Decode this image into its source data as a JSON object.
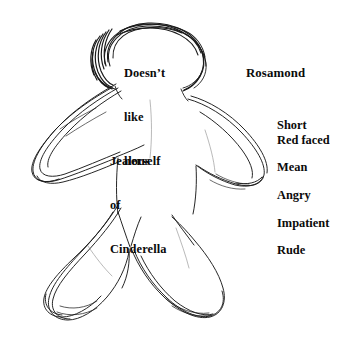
{
  "figure": {
    "title": "Rosamond",
    "stroke_color": "#1a1a1a",
    "background_color": "#ffffff"
  },
  "annotations": {
    "head": {
      "name": "doesnt-like-herself",
      "lines": [
        "Doesn’t",
        "like",
        "herself"
      ],
      "location": "head"
    },
    "torso": {
      "name": "jealous-of-cinderella",
      "lines": [
        "Jealous",
        "of",
        "Cinderella"
      ],
      "location": "torso"
    }
  },
  "traits": {
    "heading": "Rosamond",
    "items": [
      {
        "label": "Short",
        "spacing": "first"
      },
      {
        "label": "Red faced",
        "spacing": "tight"
      },
      {
        "label": "Mean",
        "spacing": "spaced"
      },
      {
        "label": "Angry",
        "spacing": "spaced"
      },
      {
        "label": "Impatient",
        "spacing": "spaced"
      },
      {
        "label": "Rude",
        "spacing": "spaced"
      }
    ]
  }
}
